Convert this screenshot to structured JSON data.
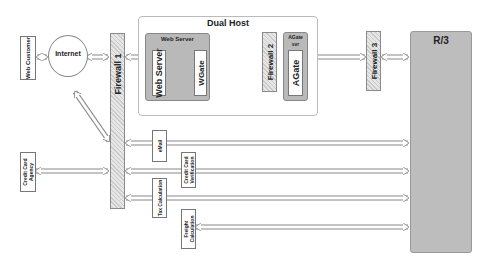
{
  "diagram": {
    "nodes": {
      "web_customer": "Web Customer",
      "internet": "Internet",
      "firewall1": "Firewall 1",
      "dual_host": "Dual Host",
      "web_server_group": "Web Server",
      "web_server": "Web Server",
      "wgate": "WGate",
      "firewall2": "Firewall 2",
      "agate_svr": "AGate svr",
      "agate": "AGate",
      "firewall3": "Firewall 3",
      "r3": "R/3",
      "credit_card_agency": "Credit Card Agency",
      "email": "eMail",
      "credit_card_verification": "Credit Card Verification",
      "tax_calculation": "Tax Calculation",
      "freight_calculation": "Freight Calculation"
    },
    "colors": {
      "server_fill": "#b9b9b9",
      "r3_fill": "#bdbdbd",
      "firewall_hatch": "#c9c9c9"
    }
  }
}
